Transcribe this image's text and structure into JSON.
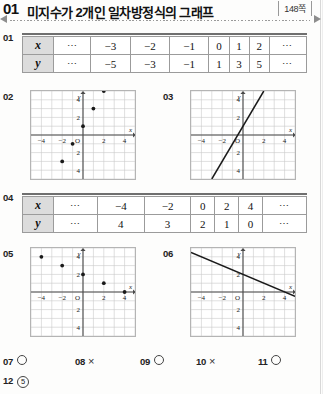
{
  "header": {
    "number": "01",
    "title": "미지수가 2개인 일차방정식의 그래프",
    "page_badge": "148쪽"
  },
  "questions": {
    "q01": "01",
    "q02": "02",
    "q03": "03",
    "q04": "04",
    "q05": "05",
    "q06": "06"
  },
  "table1": {
    "row_labels": [
      "x",
      "y"
    ],
    "x_values": [
      "⋯",
      "−3",
      "−2",
      "−1",
      "0",
      "1",
      "2",
      "⋯"
    ],
    "y_values": [
      "⋯",
      "−5",
      "−3",
      "−1",
      "1",
      "3",
      "5",
      "⋯"
    ]
  },
  "table2": {
    "row_labels": [
      "x",
      "y"
    ],
    "x_values": [
      "⋯",
      "−4",
      "−2",
      "0",
      "2",
      "4",
      "⋯"
    ],
    "y_values": [
      "⋯",
      "4",
      "3",
      "2",
      "1",
      "0",
      "⋯"
    ]
  },
  "graph_common": {
    "axis_label_x": "x",
    "axis_label_y": "y",
    "origin_label": "O",
    "x_ticks": [
      {
        "v": -4,
        "label": "−4"
      },
      {
        "v": -2,
        "label": "−2"
      },
      {
        "v": 2,
        "label": "2"
      },
      {
        "v": 4,
        "label": "4"
      }
    ],
    "y_ticks": [
      {
        "v": 4,
        "label": "4"
      },
      {
        "v": 2,
        "label": "2"
      },
      {
        "v": -2,
        "label": "2"
      },
      {
        "v": -4,
        "label": "4"
      }
    ],
    "xlim": [
      -5,
      5
    ],
    "ylim": [
      -5,
      5
    ],
    "grid": true,
    "grid_color": "#c9c9c9",
    "axis_color": "#4a4a4a",
    "plot_color": "#1a1a1a"
  },
  "chart_data": [
    {
      "id": "graph-02",
      "type": "scatter",
      "title": "02",
      "xlabel": "x",
      "ylabel": "y",
      "xlim": [
        -5,
        5
      ],
      "ylim": [
        -5,
        5
      ],
      "grid": true,
      "points": [
        {
          "x": -2,
          "y": -3
        },
        {
          "x": -1,
          "y": -1
        },
        {
          "x": 0,
          "y": 1
        },
        {
          "x": 1,
          "y": 3
        },
        {
          "x": 2,
          "y": 5
        }
      ]
    },
    {
      "id": "graph-03",
      "type": "line",
      "title": "03",
      "xlabel": "x",
      "ylabel": "y",
      "xlim": [
        -5,
        5
      ],
      "ylim": [
        -5,
        5
      ],
      "grid": true,
      "slope": 2,
      "intercept": 1,
      "segment": [
        {
          "x": -3,
          "y": -5
        },
        {
          "x": 2,
          "y": 5
        }
      ]
    },
    {
      "id": "graph-05",
      "type": "scatter",
      "title": "05",
      "xlabel": "x",
      "ylabel": "y",
      "xlim": [
        -5,
        5
      ],
      "ylim": [
        -5,
        5
      ],
      "grid": true,
      "points": [
        {
          "x": -4,
          "y": 4
        },
        {
          "x": -2,
          "y": 3
        },
        {
          "x": 0,
          "y": 2
        },
        {
          "x": 2,
          "y": 1
        },
        {
          "x": 4,
          "y": 0
        }
      ]
    },
    {
      "id": "graph-06",
      "type": "line",
      "title": "06",
      "xlabel": "x",
      "ylabel": "y",
      "xlim": [
        -5,
        5
      ],
      "ylim": [
        -5,
        5
      ],
      "grid": true,
      "slope": -0.5,
      "intercept": 2,
      "segment": [
        {
          "x": -5,
          "y": 4.5
        },
        {
          "x": 5,
          "y": -0.5
        }
      ]
    }
  ],
  "answers": [
    {
      "num": "07",
      "mark": "circle"
    },
    {
      "num": "08",
      "mark": "cross",
      "glyph": "×"
    },
    {
      "num": "09",
      "mark": "circle"
    },
    {
      "num": "10",
      "mark": "cross",
      "glyph": "×"
    },
    {
      "num": "11",
      "mark": "circle"
    },
    {
      "num": "12",
      "mark": "choice",
      "glyph": "5"
    }
  ]
}
